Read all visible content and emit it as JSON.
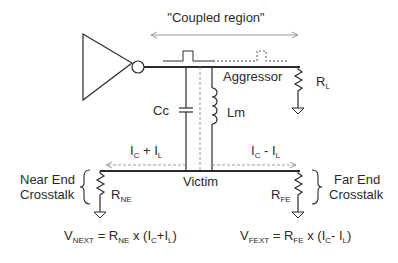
{
  "diagram": {
    "title": "\"Coupled region\"",
    "aggressor_label": "Aggressor",
    "victim_label": "Victim",
    "components": {
      "coupling_capacitor": "Cc",
      "mutual_inductance": "Lm",
      "load_resistor": {
        "main": "R",
        "sub": "L"
      },
      "near_end_resistor": {
        "main": "R",
        "sub": "NE"
      },
      "far_end_resistor": {
        "main": "R",
        "sub": "FE"
      }
    },
    "currents": {
      "near_end": {
        "a": "I",
        "a_sub": "C",
        "op": " + ",
        "b": "I",
        "b_sub": "L"
      },
      "far_end": {
        "a": "I",
        "a_sub": "C",
        "op": " - ",
        "b": "I",
        "b_sub": "L"
      }
    },
    "near_end_crosstalk": {
      "line1": "Near End",
      "line2": "Crosstalk"
    },
    "far_end_crosstalk": {
      "line1": "Far End",
      "line2": "Crosstalk"
    },
    "equations": {
      "next": {
        "v": "V",
        "v_sub": "NEXT",
        "eq": " = ",
        "r": "R",
        "r_sub": "NE",
        "rest1": " x (I",
        "c_sub": "C",
        "plus": "+I",
        "l_sub": "L",
        "close": ")"
      },
      "fext": {
        "v": "V",
        "v_sub": "FEXT",
        "eq": " = ",
        "r": "R",
        "r_sub": "FE",
        "rest1": " x  (I",
        "c_sub": "C",
        "minus": "- I",
        "l_sub": "L",
        "close": ")"
      }
    },
    "colors": {
      "line": "#2a2a2a",
      "dashed": "#9a9a9a",
      "text": "#2a2a2a"
    }
  }
}
